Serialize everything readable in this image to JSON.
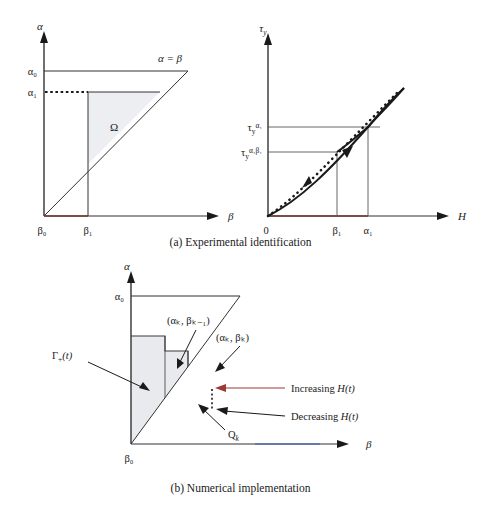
{
  "document": {
    "type": "scientific-figure",
    "description": "Two-part figure showing Preisach hysteresis model: experimental identification and numerical implementation"
  },
  "colors": {
    "ink": "#1a1a1a",
    "line": "#333333",
    "omega_fill": "#eceef2",
    "step_fill": "#e8eaee",
    "qk_fill": "#8d8d8d",
    "increasing_arrow": "#9c3a36",
    "axis_accent_red": "#b03a2e",
    "axis_accent_blue": "#3b5bb5",
    "background": "#ffffff"
  },
  "panel_a": {
    "caption": "(a) Experimental identification",
    "left_plot": {
      "y_axis_label": "α",
      "x_axis_label": "β",
      "y_ticks": [
        "α₀",
        "α₁"
      ],
      "x_ticks": [
        "β₀",
        "β₁"
      ],
      "diagonal_label": "α = β",
      "region_label": "Ω",
      "dotted_line_from": "α₁",
      "shaded_region": "Ω"
    },
    "right_plot": {
      "y_axis_label": "τ",
      "y_axis_label_sub": "y",
      "x_axis_label": "H",
      "origin_label": "0",
      "y_ticks": [
        {
          "base": "τ",
          "sub": "y",
          "sup": "α₁"
        },
        {
          "base": "τ",
          "sub": "y",
          "sup": "α₁β₁"
        }
      ],
      "x_ticks": [
        "β₁",
        "α₁"
      ],
      "curve_type": "hysteresis-loop",
      "dotted_curve": "initial-magnetization-curve"
    }
  },
  "panel_b": {
    "caption": "(b) Numerical implementation",
    "y_axis_label": "α",
    "x_axis_label": "β",
    "y_ticks": [
      "α₀"
    ],
    "x_ticks": [
      "β₀"
    ],
    "annotations": [
      {
        "id": "gamma",
        "base": "Γ",
        "sub": "+",
        "tail": "(t)"
      },
      {
        "id": "vertex-upper",
        "text": "(αₖ, βₖ₋₁)"
      },
      {
        "id": "vertex-lower",
        "text": "(αₖ, βₖ)"
      },
      {
        "id": "increasing",
        "text": "Increasing H(t)"
      },
      {
        "id": "decreasing",
        "text": "Decreasing H(t)"
      },
      {
        "id": "qk",
        "base": "Q",
        "sub": "k"
      }
    ],
    "staircase_steps": 4,
    "highlighted_cell": "Qₖ"
  }
}
